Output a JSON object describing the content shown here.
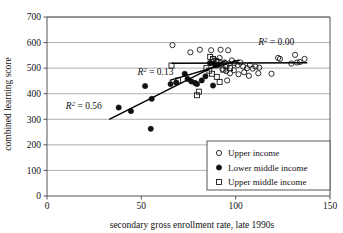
{
  "chart_data": {
    "type": "scatter",
    "title": "",
    "xlabel": "secondary gross enrollment rate, late 1990s",
    "ylabel": "combined learning score",
    "xlim": [
      0,
      150
    ],
    "ylim": [
      0,
      700
    ],
    "xticks": [
      0,
      50,
      100,
      150
    ],
    "yticks": [
      0,
      100,
      200,
      300,
      400,
      500,
      600,
      700
    ],
    "xtick_labels": [
      "0",
      "50",
      "100",
      "150"
    ],
    "ytick_labels": [
      "0",
      "100",
      "200",
      "300",
      "400",
      "500",
      "600",
      "700"
    ],
    "grid": "horizontal",
    "legend_position": "bottom-right",
    "series": [
      {
        "name": "Upper income",
        "marker": "open-circle",
        "color": "#1a1a1a",
        "points": [
          [
            66.5,
            590
          ],
          [
            76.0,
            562
          ],
          [
            81.0,
            572
          ],
          [
            87.0,
            570
          ],
          [
            92.0,
            572
          ],
          [
            96.0,
            570
          ],
          [
            88.0,
            536
          ],
          [
            90.0,
            528
          ],
          [
            91.5,
            540
          ],
          [
            94.0,
            522
          ],
          [
            96.5,
            518
          ],
          [
            98.0,
            530
          ],
          [
            99.5,
            520
          ],
          [
            101.0,
            512
          ],
          [
            102.5,
            522
          ],
          [
            104.0,
            506
          ],
          [
            106.0,
            500
          ],
          [
            107.5,
            512
          ],
          [
            109.0,
            498
          ],
          [
            110.5,
            506
          ],
          [
            93.0,
            496
          ],
          [
            95.0,
            488
          ],
          [
            97.0,
            480
          ],
          [
            99.0,
            492
          ],
          [
            101.5,
            476
          ],
          [
            104.5,
            484
          ],
          [
            107.0,
            470
          ],
          [
            95.5,
            452
          ],
          [
            112.0,
            480
          ],
          [
            119.0,
            478
          ],
          [
            122.5,
            540
          ],
          [
            123.5,
            536
          ],
          [
            129.5,
            518
          ],
          [
            131.5,
            552
          ],
          [
            132.5,
            522
          ],
          [
            134.0,
            524
          ],
          [
            136.5,
            536
          ],
          [
            89.5,
            510
          ],
          [
            86.5,
            520
          ],
          [
            112.5,
            502
          ]
        ]
      },
      {
        "name": "Lower middle income",
        "marker": "filled-circle",
        "color": "#111111",
        "points": [
          [
            38.0,
            346
          ],
          [
            44.5,
            332
          ],
          [
            52.0,
            430
          ],
          [
            55.5,
            380
          ],
          [
            55.0,
            263
          ],
          [
            65.5,
            438
          ],
          [
            68.5,
            444
          ],
          [
            73.0,
            478
          ],
          [
            74.5,
            458
          ],
          [
            76.5,
            448
          ],
          [
            78.5,
            442
          ],
          [
            79.5,
            438
          ],
          [
            82.0,
            452
          ],
          [
            84.0,
            468
          ],
          [
            86.5,
            520
          ],
          [
            88.0,
            432
          ],
          [
            89.0,
            516
          ],
          [
            90.5,
            512
          ]
        ]
      },
      {
        "name": "Upper middle income",
        "marker": "open-square",
        "color": "#1a1a1a",
        "points": [
          [
            66.0,
            510
          ],
          [
            69.5,
            452
          ],
          [
            79.5,
            394
          ],
          [
            80.5,
            408
          ],
          [
            86.5,
            544
          ],
          [
            88.0,
            536
          ],
          [
            89.5,
            528
          ],
          [
            91.0,
            524
          ],
          [
            84.5,
            500
          ],
          [
            86.0,
            490
          ],
          [
            90.0,
            466
          ],
          [
            91.5,
            446
          ],
          [
            93.5,
            494
          ],
          [
            95.0,
            508
          ],
          [
            97.0,
            500
          ],
          [
            87.5,
            478
          ]
        ]
      }
    ],
    "trend_lines": [
      {
        "label": "R2 = 0.00",
        "r2": 0.0,
        "series": "Upper income",
        "x0": 66.0,
        "y0": 519,
        "x1": 138.0,
        "y1": 521
      },
      {
        "label": "R2 = 0.13",
        "r2": 0.13,
        "series": "Upper middle income",
        "x0": 65.0,
        "y0": 452,
        "x1": 102.0,
        "y1": 532
      },
      {
        "label": "R2 = 0.56",
        "r2": 0.56,
        "series": "Lower middle income",
        "x0": 33.0,
        "y0": 300,
        "x1": 95.0,
        "y1": 530
      }
    ],
    "annotations": [
      {
        "name": "r2-upper-income",
        "prefix": "R",
        "sup": "2",
        "value": " = 0.00",
        "x": 112.0,
        "y": 590
      },
      {
        "name": "r2-upper-middle-income",
        "prefix": "R",
        "sup": "2",
        "value": " = 0.13",
        "x": 48.0,
        "y": 472
      },
      {
        "name": "r2-lower-middle-income",
        "prefix": "R",
        "sup": "2",
        "value": " = 0.56",
        "x": 10.0,
        "y": 340
      }
    ],
    "legend": {
      "entries": [
        {
          "label": "Upper income",
          "marker": "open-circle"
        },
        {
          "label": "Lower middle income",
          "marker": "filled-circle"
        },
        {
          "label": "Upper middle income",
          "marker": "open-square"
        }
      ]
    },
    "colors": {
      "marker_stroke": "#1a1a1a",
      "marker_fill": "#111111",
      "grid": "#9a9a9a",
      "axis": "#555555",
      "trend": "#000000",
      "background": "#ffffff"
    }
  }
}
